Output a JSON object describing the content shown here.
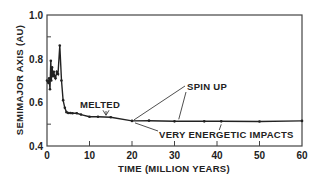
{
  "chart_data": {
    "type": "line",
    "title": "",
    "xlabel": "TIME (MILLION YEARS)",
    "ylabel": "SEMIMAJOR AXIS (AU)",
    "xlim": [
      0,
      60
    ],
    "ylim": [
      0.4,
      1.0
    ],
    "xticks": [
      0,
      10,
      20,
      30,
      40,
      50,
      60
    ],
    "xtick_labels": [
      "0",
      "10",
      "20",
      "30",
      "40",
      "50",
      "60"
    ],
    "yticks": [
      0.4,
      0.6,
      0.8,
      1.0
    ],
    "ytick_labels": [
      "0.4",
      "0.6",
      "0.8",
      "1.0"
    ],
    "grid": false,
    "legend": null,
    "series": [
      {
        "name": "semimajor axis",
        "x": [
          0,
          0.3,
          0.5,
          0.7,
          0.9,
          1.0,
          1.2,
          1.4,
          1.6,
          1.8,
          2.0,
          2.3,
          2.6,
          3.0,
          3.4,
          3.8,
          4.2,
          4.6,
          5.0,
          5.5,
          6.0,
          7.0,
          8.0,
          10.0,
          12.0,
          15.0,
          20.0,
          24.0,
          30.0,
          37.0,
          41.0,
          50.0,
          60.0
        ],
        "y": [
          0.7,
          0.69,
          0.71,
          0.66,
          0.79,
          0.7,
          0.76,
          0.72,
          0.74,
          0.72,
          0.71,
          0.74,
          0.73,
          0.86,
          0.7,
          0.61,
          0.575,
          0.555,
          0.551,
          0.551,
          0.55,
          0.55,
          0.544,
          0.534,
          0.534,
          0.532,
          0.515,
          0.516,
          0.513,
          0.513,
          0.513,
          0.512,
          0.515
        ]
      }
    ],
    "annotations": [
      {
        "text": "MELTED",
        "x": 14,
        "y": 0.535,
        "arrow": true
      },
      {
        "text": "SPIN UP",
        "x": [
          20,
          31
        ],
        "y": 0.515,
        "arrow": true
      },
      {
        "text": "VERY ENERGETIC IMPACTS",
        "x": [
          20,
          41
        ],
        "y": 0.515,
        "arrow": true
      }
    ]
  },
  "labels": {
    "ylabel": "SEMIMAJOR AXIS (AU)",
    "xlabel": "TIME (MILLION YEARS)",
    "melted": "MELTED",
    "spin_up": "SPIN UP",
    "impacts": "VERY ENERGETIC IMPACTS"
  },
  "colors": {
    "line": "#222222",
    "axis": "#444444",
    "background": "#ffffff"
  }
}
